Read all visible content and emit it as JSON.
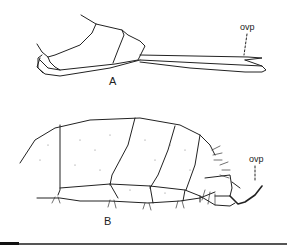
{
  "figure": {
    "panels": [
      {
        "id": "A",
        "label": "A",
        "annotation": "ovp"
      },
      {
        "id": "B",
        "label": "B",
        "annotation": "ovp"
      }
    ]
  }
}
